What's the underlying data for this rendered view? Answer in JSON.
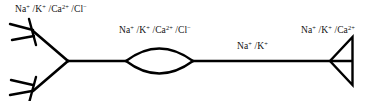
{
  "figure": {
    "background_color": "#ffffff",
    "stroke_color": "#000000",
    "width": 376,
    "height": 101
  },
  "labels": {
    "dendritic": {
      "text": "Na+ /K+ /Ca2+ /Cl-",
      "ions": [
        {
          "symbol": "Na",
          "charge": "+"
        },
        {
          "symbol": "K",
          "charge": "+"
        },
        {
          "symbol": "Ca",
          "charge": "2+"
        },
        {
          "symbol": "Cl",
          "charge": "−"
        }
      ],
      "separator": " /"
    },
    "soma": {
      "text": "Na+ /K+ /Ca2+ /Cl-",
      "ions": [
        {
          "symbol": "Na",
          "charge": "+"
        },
        {
          "symbol": "K",
          "charge": "+"
        },
        {
          "symbol": "Ca",
          "charge": "2+"
        },
        {
          "symbol": "Cl",
          "charge": "−"
        }
      ],
      "separator": " /"
    },
    "axon": {
      "text": "Na+ /K+",
      "ions": [
        {
          "symbol": "Na",
          "charge": "+"
        },
        {
          "symbol": "K",
          "charge": "+"
        }
      ],
      "separator": " /"
    },
    "terminal": {
      "text": "Na+ /K+ /Ca2+",
      "ions": [
        {
          "symbol": "Na",
          "charge": "+"
        },
        {
          "symbol": "K",
          "charge": "+"
        },
        {
          "symbol": "Ca",
          "charge": "2+"
        }
      ],
      "separator": " /"
    }
  },
  "shapes": {
    "dendrite_upper_branch": "M 68,61 L 32,31",
    "dendrite_lower_branch": "M 68,61 L 32,91",
    "dendrite_upper_tip_stem": "M 29,20 L 35,44",
    "dendrite_upper_tip_prong_a": "M 33,31 L 10,25",
    "dendrite_upper_tip_prong_b": "M 34,36 L 12,39",
    "dendrite_lower_tip_stem": "M 35,78 L 29,102",
    "dendrite_lower_tip_prong_a": "M 33,86 L 11,81",
    "dendrite_lower_tip_prong_b": "M 32,91 L 10,94",
    "axon_segment_left": "M 68,61 L 126,61",
    "soma_lens_upper": "M 126,61 Q 159,37 193,61",
    "soma_lens_lower": "M 126,61 Q 159,85 193,61",
    "axon_segment_right": "M 193,61 L 352,61",
    "terminal_triangle": "M 352,38 L 352,84 L 331,61 Z"
  }
}
